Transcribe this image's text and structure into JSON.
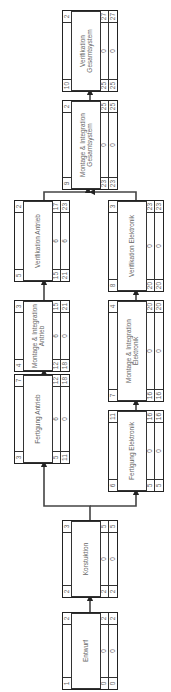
{
  "diagram": {
    "type": "precedence-network",
    "orientation": "rotated-90-ccw",
    "nodes": [
      {
        "id": "1",
        "name": "Entwurf",
        "duration": "2",
        "row1": [
          "0",
          "0",
          "2"
        ],
        "row2": [
          "0",
          "0",
          "2"
        ]
      },
      {
        "id": "2",
        "name": "Korstuktion",
        "duration": "3",
        "row1": [
          "2",
          "0",
          "5"
        ],
        "row2": [
          "2",
          "0",
          "5"
        ]
      },
      {
        "id": "3",
        "name": "Fertigung Antrieb",
        "duration": "7",
        "row1": [
          "5",
          "6",
          "12"
        ],
        "row2": [
          "11",
          "0",
          "18"
        ]
      },
      {
        "id": "6",
        "name": "Fertigung Elektronik",
        "duration": "11",
        "row1": [
          "5",
          "0",
          "16"
        ],
        "row2": [
          "5",
          "0",
          "16"
        ]
      },
      {
        "id": "4",
        "name": "Montage & Integration Antrieb",
        "duration": "3",
        "row1": [
          "12",
          "6",
          "15"
        ],
        "row2": [
          "18",
          "0",
          "21"
        ]
      },
      {
        "id": "7",
        "name": "Montage & Integration Elektronik",
        "duration": "4",
        "row1": [
          "16",
          "0",
          "20"
        ],
        "row2": [
          "16",
          "0",
          "20"
        ]
      },
      {
        "id": "5",
        "name": "Verifikation Antrieb",
        "duration": "2",
        "row1": [
          "15",
          "6",
          "17"
        ],
        "row2": [
          "21",
          "6",
          "23"
        ]
      },
      {
        "id": "8",
        "name": "Verifikation Elektronik",
        "duration": "3",
        "row1": [
          "20",
          "0",
          "23"
        ],
        "row2": [
          "20",
          "0",
          "23"
        ]
      },
      {
        "id": "9",
        "name": "Montage & Integration Gesamtsystem",
        "duration": "2",
        "row1": [
          "23",
          "0",
          "25"
        ],
        "row2": [
          "23",
          "0",
          "25"
        ]
      },
      {
        "id": "10",
        "name": "Verifikation Gesamtsystem",
        "duration": "2",
        "row1": [
          "25",
          "0",
          "27"
        ],
        "row2": [
          "25",
          "0",
          "27"
        ]
      }
    ],
    "edges": [
      [
        "1",
        "2"
      ],
      [
        "2",
        "3"
      ],
      [
        "2",
        "6"
      ],
      [
        "3",
        "4"
      ],
      [
        "6",
        "7"
      ],
      [
        "4",
        "5"
      ],
      [
        "7",
        "8"
      ],
      [
        "5",
        "9"
      ],
      [
        "8",
        "9"
      ],
      [
        "9",
        "10"
      ]
    ]
  }
}
